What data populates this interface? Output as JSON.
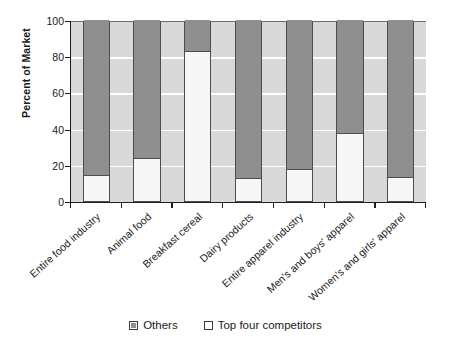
{
  "chart_data": {
    "type": "bar",
    "subtype": "stacked-100-percent",
    "title": "",
    "xlabel": "",
    "ylabel": "Percent of Market",
    "ylim": [
      0,
      100
    ],
    "yticks": [
      0,
      20,
      40,
      60,
      80,
      100
    ],
    "ytick_labels": [
      "0",
      "20",
      "40",
      "60",
      "80",
      "100"
    ],
    "grid": "horizontal",
    "legend_position": "bottom-center",
    "categories": [
      "Entire food industry",
      "Animal food",
      "Breakfast cereal",
      "Dairy products",
      "Entire apparel industry",
      "Men's and boys' apparel",
      "Women's and girls' apparel"
    ],
    "series": [
      {
        "name": "Top four competitors",
        "color": "#f7f7f7",
        "values": [
          14.5,
          24,
          83,
          12.5,
          17.5,
          37.5,
          13.5
        ]
      },
      {
        "name": "Others",
        "color": "#8f8f8f",
        "values": [
          85.5,
          76,
          17,
          87.5,
          82.5,
          62.5,
          86.5
        ]
      }
    ],
    "legend": [
      {
        "label": "Others",
        "swatch": "others"
      },
      {
        "label": "Top four competitors",
        "swatch": "top4"
      }
    ]
  },
  "colors": {
    "plot_background": "#d9d9d9",
    "gridline": "#ffffff",
    "axis": "#1f1f1f",
    "bar_border": "#4d4d4d",
    "others": "#8f8f8f",
    "top_four": "#f7f7f7",
    "page_background": "#ffffff"
  }
}
